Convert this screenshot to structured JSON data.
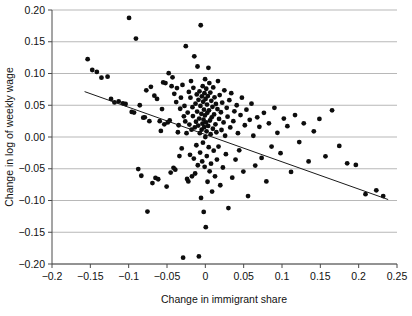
{
  "chart_data": {
    "type": "scatter",
    "title": "",
    "xlabel": "Change in immigrant share",
    "ylabel": "Change in log of weekly wage",
    "xlim": [
      -0.2,
      0.25
    ],
    "ylim": [
      -0.2,
      0.2
    ],
    "grid": true,
    "grid_axis": "y",
    "legend": "none",
    "xticks": [
      -0.2,
      -0.15,
      -0.1,
      -0.05,
      0,
      0.05,
      0.1,
      0.15,
      0.2,
      0.25
    ],
    "xticklabels": [
      "-0.2",
      "-0.15",
      "-0.1",
      "-0.05",
      "0",
      "0.05",
      "0.1",
      "0.15",
      "0.2",
      "0.25"
    ],
    "yticks": [
      0.2,
      0.15,
      0.1,
      0.05,
      0.0,
      -0.05,
      -0.1,
      -0.15,
      -0.2
    ],
    "yticklabels": [
      "0.20",
      "0.15",
      "0.10",
      "0.05",
      "0.00",
      "-0.05",
      "-0.10",
      "-0.15",
      "-0.20"
    ],
    "marker": "circle",
    "marker_color": "#0d0d0d",
    "marker_size": 2.4,
    "fit_line": {
      "type": "linear-regression",
      "color": "#1a1a1a",
      "x_start": -0.1575,
      "y_start": 0.0715,
      "x_end": 0.2385,
      "y_end": -0.0985,
      "slope": -0.4293,
      "intercept": 0.00388
    },
    "n_points": 208,
    "x": [
      -0.1535,
      -0.1475,
      -0.1415,
      -0.1355,
      -0.1275,
      -0.123,
      -0.1185,
      -0.113,
      -0.1075,
      -0.104,
      -0.0995,
      -0.096,
      -0.093,
      -0.0905,
      -0.0875,
      -0.0855,
      -0.0835,
      -0.081,
      -0.079,
      -0.077,
      -0.0755,
      -0.073,
      -0.071,
      -0.069,
      -0.0665,
      -0.065,
      -0.063,
      -0.0615,
      -0.0595,
      -0.058,
      -0.0565,
      -0.055,
      -0.0535,
      -0.052,
      -0.0505,
      -0.049,
      -0.0478,
      -0.0465,
      -0.0452,
      -0.044,
      -0.0428,
      -0.0415,
      -0.0405,
      -0.0392,
      -0.038,
      -0.037,
      -0.0358,
      -0.0348,
      -0.0338,
      -0.0328,
      -0.0318,
      -0.0308,
      -0.0298,
      -0.029,
      -0.028,
      -0.0272,
      -0.0262,
      -0.0255,
      -0.0245,
      -0.0238,
      -0.023,
      -0.0222,
      -0.0215,
      -0.0208,
      -0.02,
      -0.0194,
      -0.0187,
      -0.018,
      -0.0174,
      -0.0168,
      -0.0162,
      -0.0156,
      -0.015,
      -0.0144,
      -0.0138,
      -0.0133,
      -0.0128,
      -0.0122,
      -0.0117,
      -0.0112,
      -0.0107,
      -0.0102,
      -0.0098,
      -0.0093,
      -0.0089,
      -0.0084,
      -0.008,
      -0.0076,
      -0.0072,
      -0.0068,
      -0.0064,
      -0.006,
      -0.0056,
      -0.0052,
      -0.0048,
      -0.0045,
      -0.0041,
      -0.0038,
      -0.0034,
      -0.0031,
      -0.0028,
      -0.0024,
      -0.0021,
      -0.0018,
      -0.0015,
      -0.0012,
      -0.0009,
      -0.0006,
      -0.0003,
      0.0,
      0.0003,
      0.0006,
      0.0009,
      0.0012,
      0.0016,
      0.0019,
      0.0022,
      0.0026,
      0.0029,
      0.0033,
      0.0037,
      0.004,
      0.0044,
      0.0048,
      0.0052,
      0.0056,
      0.006,
      0.0065,
      0.0069,
      0.0074,
      0.0078,
      0.0083,
      0.0088,
      0.0093,
      0.0098,
      0.0103,
      0.0109,
      0.0114,
      0.012,
      0.0126,
      0.0132,
      0.0138,
      0.0144,
      0.0151,
      0.0158,
      0.0165,
      0.0172,
      0.0179,
      0.0187,
      0.0195,
      0.0203,
      0.0211,
      0.022,
      0.0229,
      0.0238,
      0.0248,
      0.0258,
      0.0268,
      0.0279,
      0.029,
      0.0301,
      0.0313,
      0.0325,
      0.0338,
      0.0351,
      0.0365,
      0.0379,
      0.0394,
      0.0409,
      0.0425,
      0.0442,
      0.0459,
      0.0477,
      0.0496,
      0.0515,
      0.0536,
      0.0557,
      0.0579,
      0.0602,
      0.0626,
      0.0651,
      0.0677,
      0.0705,
      0.0734,
      0.0764,
      0.0796,
      0.0829,
      0.0864,
      0.0901,
      0.094,
      0.0981,
      0.1024,
      0.107,
      0.1118,
      0.117,
      0.1225,
      0.1284,
      0.1347,
      0.1415,
      0.1488,
      0.1567,
      0.1653,
      0.1747,
      0.185,
      0.1963,
      0.2089,
      0.223,
      0.232
    ],
    "y": [
      0.1225,
      0.1055,
      0.1025,
      0.0935,
      0.095,
      0.06,
      0.0545,
      0.056,
      0.053,
      0.052,
      0.1875,
      0.0395,
      0.0385,
      0.155,
      -0.0505,
      0.05,
      -0.061,
      0.0305,
      0.031,
      0.0735,
      -0.1175,
      0.025,
      0.079,
      -0.0725,
      0.065,
      -0.0645,
      0.06,
      -0.0665,
      0.025,
      0.0095,
      0.044,
      0.086,
      0.02,
      0.085,
      -0.078,
      0.023,
      0.1005,
      0.026,
      -0.056,
      0.08,
      0.094,
      -0.0485,
      0.068,
      -0.0515,
      0.055,
      0.077,
      0.0075,
      0.0185,
      -0.03,
      0.0445,
      0.062,
      -0.018,
      0.082,
      -0.19,
      0.0325,
      0.049,
      0.0245,
      0.143,
      0.006,
      -0.066,
      0.0385,
      -0.07,
      0.071,
      0.0195,
      -0.028,
      0.062,
      0.088,
      0.0115,
      -0.062,
      0.047,
      0.033,
      0.0775,
      -0.034,
      0.127,
      0.015,
      -0.0575,
      0.0525,
      0.024,
      -0.013,
      0.067,
      0.04,
      0.111,
      -0.0445,
      0.018,
      0.0585,
      -0.188,
      0.029,
      0.072,
      0.006,
      -0.0245,
      0.049,
      0.176,
      -0.096,
      0.0365,
      0.0115,
      0.064,
      -0.0385,
      0.021,
      0.08,
      -0.009,
      0.0555,
      0.0275,
      -0.118,
      0.043,
      0.0155,
      0.069,
      -0.047,
      0.034,
      0.091,
      0.0,
      0.06,
      -0.142,
      0.023,
      0.076,
      0.009,
      -0.03,
      0.051,
      0.038,
      -0.0705,
      0.0645,
      0.0175,
      0.109,
      -0.016,
      0.042,
      0.085,
      -0.054,
      0.026,
      0.07,
      0.0045,
      -0.042,
      0.057,
      0.031,
      -0.086,
      0.0475,
      0.013,
      0.078,
      -0.0215,
      0.0355,
      0.0625,
      -0.062,
      0.02,
      0.052,
      0.0075,
      -0.0355,
      0.044,
      0.088,
      -0.015,
      0.0285,
      0.066,
      -0.076,
      0.039,
      0.011,
      0.054,
      -0.048,
      0.023,
      0.0735,
      0.002,
      -0.027,
      0.046,
      0.032,
      -0.112,
      0.058,
      0.015,
      0.069,
      -0.064,
      0.025,
      0.0405,
      -0.0355,
      0.05,
      0.006,
      -0.021,
      0.0345,
      0.062,
      -0.0545,
      0.0185,
      0.043,
      -0.093,
      0.027,
      0.0525,
      0.002,
      -0.045,
      0.031,
      0.016,
      -0.033,
      0.038,
      -0.07,
      0.0215,
      -0.015,
      0.046,
      0.0065,
      -0.0255,
      0.029,
      0.017,
      -0.055,
      0.0345,
      -0.008,
      0.0215,
      -0.0385,
      0.009,
      0.0285,
      -0.0305,
      0.042,
      -0.014,
      -0.0415,
      -0.044,
      -0.09,
      -0.084,
      -0.093
    ]
  },
  "axis": {
    "x_title": "Change in immigrant share",
    "y_title": "Change in log of weekly wage"
  }
}
